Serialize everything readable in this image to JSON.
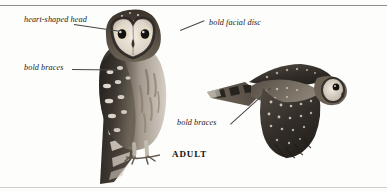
{
  "plate": {
    "caption": "ADULT",
    "rules": {
      "top": "#8d8d8d",
      "bottom": "#cfcfcf"
    },
    "background": "#fdfdfc",
    "ink": "#1c1a18"
  },
  "labels": {
    "heart_shaped_head": "heart-shaped head",
    "bold_facial_disc": "bold facial disc",
    "bold_braces_perched": "bold braces",
    "bold_braces_flight": "bold braces"
  },
  "figures": {
    "perched": {
      "name": "perched owl",
      "pose": "frontal perched adult owl"
    },
    "flight": {
      "name": "flying owl",
      "pose": "adult owl in flight, facing right"
    }
  }
}
